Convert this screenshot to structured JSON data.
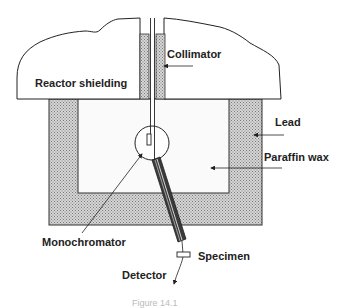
{
  "diagram": {
    "type": "neutron-diffractometer-schematic",
    "labels": {
      "collimator": "Collimator",
      "reactor_shielding": "Reactor shielding",
      "lead": "Lead",
      "paraffin_wax": "Paraffin wax",
      "monochromator": "Monochromator",
      "specimen": "Specimen",
      "detector": "Detector"
    },
    "caption": "Figure 14.1",
    "colors": {
      "stroke": "#222222",
      "hatch_fill": "#b8b8b8",
      "tube_fill": "#3a3a3a",
      "background": "#ffffff"
    }
  }
}
